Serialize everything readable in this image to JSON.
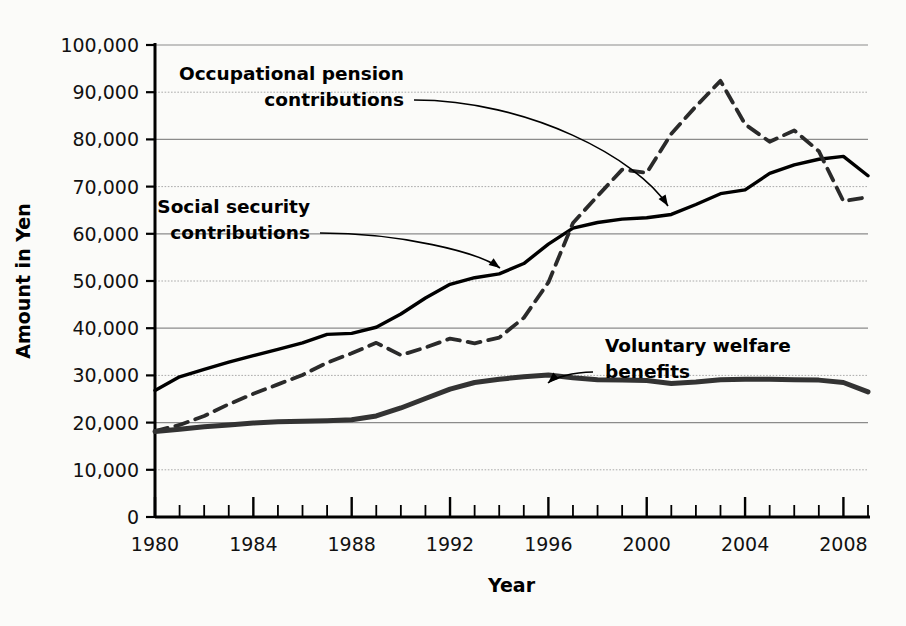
{
  "chart_data": {
    "type": "line",
    "title": "",
    "xlabel": "Year",
    "ylabel": "Amount in Yen",
    "xlim": [
      1980,
      2009
    ],
    "ylim": [
      0,
      100000
    ],
    "grid": true,
    "legend_position": "inline-annotations",
    "x_tick_labels": [
      "1980",
      "1984",
      "1988",
      "1992",
      "1996",
      "2000",
      "2004",
      "2008"
    ],
    "x_tick_values": [
      1980,
      1984,
      1988,
      1992,
      1996,
      2000,
      2004,
      2008
    ],
    "x_minor_tick_interval": 1,
    "y_tick_labels": [
      "0",
      "10,000",
      "20,000",
      "30,000",
      "40,000",
      "50,000",
      "60,000",
      "70,000",
      "80,000",
      "90,000",
      "100,000"
    ],
    "y_tick_values": [
      0,
      10000,
      20000,
      30000,
      40000,
      50000,
      60000,
      70000,
      80000,
      90000,
      100000
    ],
    "x": [
      1980,
      1981,
      1982,
      1983,
      1984,
      1985,
      1986,
      1987,
      1988,
      1989,
      1990,
      1991,
      1992,
      1993,
      1994,
      1995,
      1996,
      1997,
      1998,
      1999,
      2000,
      2001,
      2002,
      2003,
      2004,
      2005,
      2006,
      2007,
      2008,
      2009
    ],
    "series": [
      {
        "name": "Social security contributions",
        "style": "solid",
        "color": "#000000",
        "width": 3.4,
        "values": [
          26800,
          29700,
          31300,
          32800,
          34200,
          35500,
          36900,
          38700,
          38900,
          40200,
          43000,
          46400,
          49300,
          50700,
          51500,
          53700,
          57800,
          61200,
          62400,
          63100,
          63400,
          64100,
          66200,
          68500,
          69300,
          72800,
          74600,
          75800,
          76400,
          72300
        ]
      },
      {
        "name": "Occupational pension contributions",
        "style": "dashed",
        "color": "#2a2a2a",
        "width": 3.8,
        "values": [
          18200,
          19500,
          21400,
          23900,
          26100,
          28100,
          30100,
          32700,
          34700,
          36900,
          34300,
          35900,
          37800,
          36800,
          38000,
          42200,
          49700,
          62300,
          68000,
          73600,
          72900,
          81200,
          87000,
          92400,
          83200,
          79500,
          81900,
          77500,
          66900,
          67800
        ]
      },
      {
        "name": "Voluntary welfare benefits",
        "style": "solid-gray",
        "color": "#333333",
        "width": 5.0,
        "values": [
          18100,
          18600,
          19100,
          19500,
          19900,
          20200,
          20300,
          20400,
          20600,
          21400,
          23100,
          25100,
          27100,
          28500,
          29200,
          29700,
          30100,
          29500,
          29100,
          29000,
          28900,
          28300,
          28600,
          29100,
          29200,
          29200,
          29100,
          29000,
          28500,
          26500
        ]
      }
    ],
    "annotations": [
      {
        "id": "occupational-pension-annotation",
        "lines": [
          "Occupational pension",
          "contributions"
        ],
        "text_x": 404,
        "text_y": 80,
        "align": "end",
        "target_x": 668,
        "target_y": 206
      },
      {
        "id": "social-security-annotation",
        "lines": [
          "Social security",
          "contributions"
        ],
        "text_x": 310,
        "text_y": 213,
        "align": "end",
        "target_x": 500,
        "target_y": 268
      },
      {
        "id": "voluntary-welfare-annotation",
        "lines": [
          "Voluntary welfare",
          "benefits"
        ],
        "text_x": 605,
        "text_y": 352,
        "align": "start",
        "target_x": 548,
        "target_y": 383
      }
    ]
  }
}
